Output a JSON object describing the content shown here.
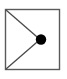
{
  "diagram": {
    "name": "cone-projection-icon",
    "canvas": {
      "width": 67,
      "height": 79,
      "background_color": "#ffffff"
    },
    "frame": {
      "name": "rectangle-border",
      "x": 5.5,
      "y": 9.5,
      "width": 54,
      "height": 60,
      "stroke_color": "#5a5a5a",
      "stroke_width": 1.4,
      "fill_color": "#ffffff"
    },
    "lines": [
      {
        "name": "upper-diagonal",
        "x1": 6,
        "y1": 10,
        "x2": 40,
        "y2": 39.5,
        "stroke_color": "#4a4a4a",
        "stroke_width": 1.3
      },
      {
        "name": "lower-diagonal",
        "x1": 6,
        "y1": 69,
        "x2": 40,
        "y2": 39.5,
        "stroke_color": "#4a4a4a",
        "stroke_width": 1.3
      }
    ],
    "vertex": {
      "name": "vertex-dot",
      "cx": 41,
      "cy": 39.5,
      "r": 5.2,
      "fill_color": "#000000"
    }
  }
}
